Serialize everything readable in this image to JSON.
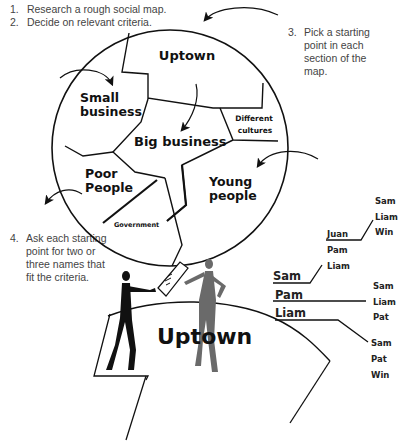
{
  "steps": [
    {
      "num": "1.",
      "text": "Research a rough social map."
    },
    {
      "num": "2.",
      "text": "Decide on relevant criteria."
    },
    {
      "num": "3.",
      "lines": [
        "Pick a starting",
        "point in each",
        "section of the",
        "map."
      ]
    },
    {
      "num": "4.",
      "lines": [
        "Ask each starting",
        "point for two or",
        "three names that",
        "fit the criteria."
      ]
    }
  ],
  "social_map": {
    "sections": [
      "Uptown",
      "Small business",
      "Big business",
      "Different cultures",
      "Poor People",
      "Young people",
      "Government"
    ]
  },
  "illustration": {
    "label": "Uptown"
  },
  "name_tree": {
    "roots": [
      "Sam",
      "Pam",
      "Liam"
    ],
    "sam_children": [
      "Juan",
      "Pam",
      "Liam"
    ],
    "juan_children": [
      "Sam",
      "Liam",
      "Win"
    ],
    "pam_children": [
      "Sam",
      "Liam",
      "Pat"
    ],
    "liam_children": [
      "Sam",
      "Pat",
      "Win"
    ]
  }
}
